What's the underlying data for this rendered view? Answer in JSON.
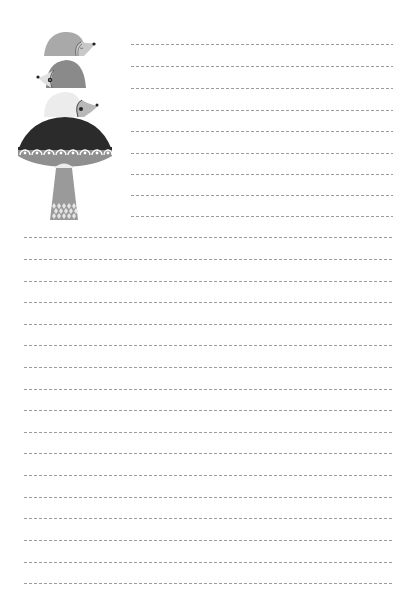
{
  "page": {
    "type": "lined-stationery",
    "background": "#ffffff",
    "rule_color": "#9c9c9c",
    "rule_style": "dashed"
  },
  "illustration": {
    "subject": "three hedgehogs stacked on a mushroom",
    "colors": {
      "hedgehog_top": "#a9a9a9",
      "hedgehog_middle": "#8a8a8a",
      "hedgehog_bottom": "#ececec",
      "face": "#c8c8c8",
      "cap_dark": "#2b2b2b",
      "cap_band": "#8f8f8f",
      "scallop": "#ffffff",
      "stem": "#9a9a9a",
      "stem_gills": "#e6e6e6"
    }
  },
  "rules_top": {
    "x_start": 131,
    "x_end": 393,
    "y": [
      44,
      66,
      88,
      110,
      131,
      153,
      174,
      195,
      216
    ]
  },
  "rules_full": {
    "x_start": 24,
    "x_end": 393,
    "y": [
      237,
      259,
      281,
      302,
      324,
      345,
      367,
      389,
      410,
      432,
      453,
      475,
      497,
      518,
      540,
      562,
      583
    ]
  }
}
